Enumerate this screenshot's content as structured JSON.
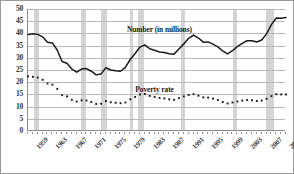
{
  "chart_data": {
    "type": "line",
    "title": "",
    "xlabel": "",
    "ylabel": "",
    "ylim": [
      0,
      50
    ],
    "xlim": [
      1959,
      2012
    ],
    "grid": true,
    "legend_position": "inline-annotations",
    "ytick_labels": [
      "0",
      "5",
      "10",
      "15",
      "20",
      "25",
      "30",
      "35",
      "40",
      "45",
      "50"
    ],
    "ytick_values": [
      0,
      5,
      10,
      15,
      20,
      25,
      30,
      35,
      40,
      45,
      50
    ],
    "xtick_labels": [
      "1959",
      "1963",
      "1967",
      "1971",
      "1975",
      "1979",
      "1983",
      "1987",
      "1991",
      "1995",
      "1999",
      "2003",
      "2007",
      "2011"
    ],
    "xtick_values": [
      1959,
      1963,
      1967,
      1971,
      1975,
      1979,
      1983,
      1987,
      1991,
      1995,
      1999,
      2003,
      2007,
      2011
    ],
    "annotations": [
      {
        "name": "number-series-label",
        "text": "Number (in millions)",
        "x": 1986,
        "y": 41.5
      },
      {
        "name": "poverty-rate-series-label",
        "text": "Poverty rate",
        "x": 1985,
        "y": 17.0
      }
    ],
    "recession_bands": [
      {
        "start": 1960.3,
        "end": 1961.2
      },
      {
        "start": 1969.9,
        "end": 1970.9
      },
      {
        "start": 1973.9,
        "end": 1975.2
      },
      {
        "start": 1980.0,
        "end": 1980.6
      },
      {
        "start": 1981.5,
        "end": 1982.9
      },
      {
        "start": 1990.5,
        "end": 1991.2
      },
      {
        "start": 2001.2,
        "end": 2001.9
      },
      {
        "start": 2007.9,
        "end": 2009.5
      }
    ],
    "x": [
      1959,
      1960,
      1961,
      1962,
      1963,
      1964,
      1965,
      1966,
      1967,
      1968,
      1969,
      1970,
      1971,
      1972,
      1973,
      1974,
      1975,
      1976,
      1977,
      1978,
      1979,
      1980,
      1981,
      1982,
      1983,
      1984,
      1985,
      1986,
      1987,
      1988,
      1989,
      1990,
      1991,
      1992,
      1993,
      1994,
      1995,
      1996,
      1997,
      1998,
      1999,
      2000,
      2001,
      2002,
      2003,
      2004,
      2005,
      2006,
      2007,
      2008,
      2009,
      2010,
      2011,
      2012
    ],
    "series": [
      {
        "name": "Number (in millions)",
        "style": "solid",
        "color": "#1a1a1a",
        "values": [
          39.5,
          39.9,
          39.6,
          38.6,
          36.4,
          36.1,
          33.2,
          28.5,
          27.8,
          25.4,
          24.1,
          25.4,
          25.6,
          24.5,
          23.0,
          23.4,
          25.9,
          25.0,
          24.7,
          24.5,
          26.1,
          29.3,
          31.8,
          34.4,
          35.3,
          33.7,
          33.1,
          32.4,
          32.2,
          31.7,
          31.5,
          33.6,
          35.7,
          38.0,
          39.3,
          38.1,
          36.4,
          36.5,
          35.6,
          34.5,
          32.8,
          31.6,
          32.9,
          34.6,
          35.9,
          37.0,
          37.0,
          36.5,
          37.3,
          39.8,
          43.6,
          46.3,
          46.2,
          46.5
        ]
      },
      {
        "name": "Poverty rate",
        "style": "dotted",
        "color": "#1a1a1a",
        "values": [
          22.4,
          22.2,
          21.9,
          21.0,
          19.5,
          19.0,
          17.3,
          14.7,
          14.2,
          12.8,
          12.1,
          12.6,
          12.5,
          11.9,
          11.1,
          11.2,
          12.3,
          11.8,
          11.6,
          11.4,
          11.7,
          13.0,
          14.0,
          15.0,
          15.2,
          14.4,
          14.0,
          13.6,
          13.4,
          13.0,
          12.8,
          13.5,
          14.2,
          14.8,
          15.1,
          14.5,
          13.8,
          13.7,
          13.3,
          12.7,
          11.9,
          11.3,
          11.7,
          12.1,
          12.5,
          12.7,
          12.6,
          12.3,
          12.5,
          13.2,
          14.3,
          15.1,
          15.0,
          15.0
        ]
      }
    ]
  },
  "axes": {
    "y_axis_name": "y-axis",
    "x_axis_name": "x-axis"
  }
}
